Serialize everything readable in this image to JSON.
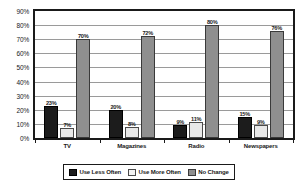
{
  "chart_data": {
    "type": "bar",
    "title": "",
    "xlabel": "",
    "ylabel": "",
    "categories": [
      "TV",
      "Magazines",
      "Radio",
      "Newspapers"
    ],
    "series": [
      {
        "name": "Use Less Often",
        "color": "#1c1c1c",
        "values": [
          23,
          20,
          9,
          15
        ]
      },
      {
        "name": "Use More Often",
        "color": "#e8e8e8",
        "values": [
          7,
          8,
          11,
          9
        ]
      },
      {
        "name": "No Change",
        "color": "#8f8f8f",
        "values": [
          70,
          72,
          80,
          76
        ]
      }
    ],
    "value_labels": [
      [
        "23%",
        "20%",
        "9%",
        "15%"
      ],
      [
        "7%",
        "8%",
        "11%",
        "9%"
      ],
      [
        "70%",
        "72%",
        "80%",
        "76%"
      ]
    ],
    "ylim": [
      0,
      90
    ],
    "y_ticks": [
      0,
      10,
      20,
      30,
      40,
      50,
      60,
      70,
      80,
      90
    ],
    "y_tick_labels": [
      "0%",
      "10%",
      "20%",
      "30%",
      "40%",
      "50%",
      "60%",
      "70%",
      "80%",
      "90%"
    ],
    "grid": true,
    "legend_position": "bottom",
    "legend": [
      "Use Less Often",
      "Use More Often",
      "No Change"
    ]
  }
}
